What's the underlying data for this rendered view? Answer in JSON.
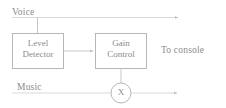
{
  "diagram": {
    "line_color": "#b9b9b9",
    "text_color": "#8c8c8c",
    "background": "#ffffff",
    "labels": {
      "voice": "Voice",
      "music": "Music",
      "to_console": "To console"
    },
    "blocks": [
      {
        "id": "level-detector",
        "line1": "Level",
        "line2": "Detector"
      },
      {
        "id": "gain-control",
        "line1": "Gain",
        "line2": "Control"
      }
    ],
    "multiplier": {
      "id": "multiplier-node",
      "symbol": "X"
    }
  }
}
